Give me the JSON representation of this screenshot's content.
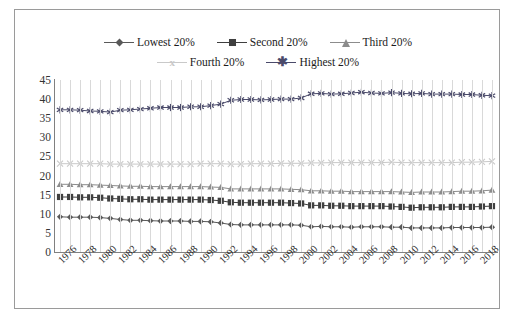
{
  "chart_data": {
    "type": "line",
    "title": "",
    "xlabel": "",
    "ylabel": "",
    "ylim": [
      0,
      45
    ],
    "ytick_step": 5,
    "yticks": [
      "0",
      "5",
      "10",
      "15",
      "20",
      "25",
      "30",
      "35",
      "40",
      "45"
    ],
    "grid": "vertical",
    "legend_position": "top-center",
    "x": [
      1976,
      1977,
      1978,
      1979,
      1980,
      1981,
      1982,
      1983,
      1984,
      1985,
      1986,
      1987,
      1988,
      1989,
      1990,
      1991,
      1992,
      1993,
      1994,
      1995,
      1996,
      1997,
      1998,
      1999,
      2000,
      2001,
      2002,
      2003,
      2004,
      2005,
      2006,
      2007,
      2008,
      2009,
      2010,
      2011,
      2012,
      2013,
      2014,
      2015,
      2016,
      2017,
      2018,
      2019
    ],
    "xtick_labels": [
      "1976",
      "1978",
      "1980",
      "1982",
      "1984",
      "1986",
      "1988",
      "1990",
      "1992",
      "1994",
      "1996",
      "1998",
      "2000",
      "2002",
      "2004",
      "2006",
      "2008",
      "2010",
      "2012",
      "2014",
      "2016",
      "2018"
    ],
    "series": [
      {
        "name": "Lowest 20%",
        "marker": "diamond",
        "color": "#595959",
        "values": [
          9.2,
          9.1,
          9.1,
          9.1,
          9.0,
          8.8,
          8.5,
          8.3,
          8.3,
          8.2,
          8.1,
          8.1,
          8.1,
          8.0,
          8.0,
          7.9,
          7.6,
          7.2,
          7.1,
          7.1,
          7.1,
          7.1,
          7.1,
          7.1,
          7.0,
          6.6,
          6.7,
          6.6,
          6.6,
          6.5,
          6.6,
          6.6,
          6.6,
          6.5,
          6.5,
          6.3,
          6.3,
          6.3,
          6.3,
          6.4,
          6.4,
          6.4,
          6.4,
          6.5
        ]
      },
      {
        "name": "Second 20%",
        "marker": "square",
        "color": "#3f3f3f",
        "values": [
          14.4,
          14.4,
          14.3,
          14.3,
          14.2,
          14.0,
          13.9,
          13.8,
          13.8,
          13.7,
          13.7,
          13.7,
          13.7,
          13.7,
          13.7,
          13.6,
          13.4,
          13.0,
          12.9,
          12.9,
          12.9,
          12.9,
          12.9,
          12.8,
          12.7,
          12.2,
          12.2,
          12.1,
          12.1,
          12.0,
          12.0,
          12.0,
          12.0,
          11.9,
          11.8,
          11.6,
          11.7,
          11.7,
          11.7,
          11.8,
          11.8,
          11.8,
          11.9,
          12.0
        ]
      },
      {
        "name": "Third 20%",
        "marker": "triangle",
        "color": "#8c8c8c",
        "values": [
          17.7,
          17.7,
          17.6,
          17.6,
          17.5,
          17.4,
          17.3,
          17.2,
          17.2,
          17.1,
          17.1,
          17.1,
          17.1,
          17.1,
          17.1,
          17.0,
          16.9,
          16.5,
          16.5,
          16.5,
          16.5,
          16.5,
          16.5,
          16.4,
          16.3,
          16.0,
          16.0,
          15.9,
          15.9,
          15.8,
          15.8,
          15.8,
          15.8,
          15.8,
          15.7,
          15.6,
          15.7,
          15.7,
          15.7,
          15.8,
          15.9,
          15.9,
          16.0,
          16.2
        ]
      },
      {
        "name": "Fourth 20%",
        "marker": "x",
        "color": "#c9c9c9",
        "values": [
          23.1,
          23.1,
          23.1,
          23.1,
          23.1,
          23.0,
          23.0,
          23.0,
          23.0,
          23.0,
          23.0,
          23.0,
          23.0,
          23.0,
          23.1,
          23.1,
          23.1,
          23.0,
          23.0,
          23.1,
          23.1,
          23.1,
          23.2,
          23.2,
          23.2,
          23.3,
          23.3,
          23.4,
          23.4,
          23.4,
          23.4,
          23.4,
          23.4,
          23.5,
          23.4,
          23.4,
          23.4,
          23.4,
          23.4,
          23.4,
          23.5,
          23.5,
          23.6,
          23.7
        ]
      },
      {
        "name": "Highest 20%",
        "marker": "asterisk",
        "color": "#4a4a6a",
        "values": [
          37.2,
          37.2,
          37.1,
          36.9,
          36.8,
          36.6,
          37.1,
          37.2,
          37.4,
          37.6,
          37.8,
          37.8,
          37.8,
          38.0,
          38.0,
          38.3,
          38.7,
          39.7,
          39.9,
          39.9,
          39.8,
          39.9,
          40.0,
          40.0,
          40.3,
          41.4,
          41.5,
          41.3,
          41.4,
          41.6,
          41.8,
          41.6,
          41.5,
          41.7,
          41.5,
          41.4,
          41.5,
          41.3,
          41.3,
          41.3,
          41.2,
          41.2,
          41.0,
          40.9
        ]
      }
    ]
  },
  "legend": {
    "rows": [
      [
        {
          "label": "Lowest 20%",
          "marker": "diamond-marker-icon",
          "color": "#595959"
        },
        {
          "label": "Second 20%",
          "marker": "square-marker-icon",
          "color": "#3f3f3f"
        },
        {
          "label": "Third 20%",
          "marker": "triangle-marker-icon",
          "color": "#8c8c8c"
        }
      ],
      [
        {
          "label": "Fourth 20%",
          "marker": "x-marker-icon",
          "color": "#c9c9c9"
        },
        {
          "label": "Highest 20%",
          "marker": "asterisk-marker-icon",
          "color": "#4a4a6a"
        }
      ]
    ]
  }
}
